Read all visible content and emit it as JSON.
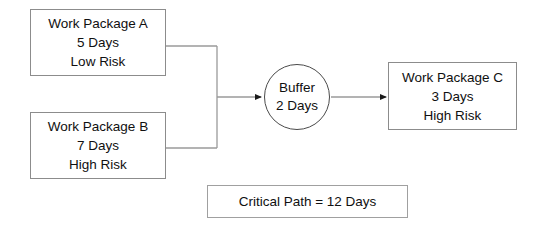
{
  "diagram": {
    "background_color": "#ffffff",
    "text_color": "#101010",
    "box_border_color": "#8c8c8c",
    "circle_border_color": "#4a4a4a",
    "edge_color": "#9a9a9a"
  },
  "nodes": {
    "work_package_a": {
      "name": "Work Package A",
      "duration": "5 Days",
      "risk": "Low Risk"
    },
    "work_package_b": {
      "name": "Work Package B",
      "duration": "7 Days",
      "risk": "High Risk"
    },
    "buffer": {
      "name": "Buffer",
      "duration": "2 Days"
    },
    "work_package_c": {
      "name": "Work Package C",
      "duration": "3 Days",
      "risk": "High Risk"
    }
  },
  "summary": {
    "critical_path": "Critical Path = 12 Days"
  },
  "edges": [
    {
      "from": "work_package_a",
      "to": "buffer",
      "arrowhead": true
    },
    {
      "from": "work_package_b",
      "to": "buffer",
      "arrowhead": true
    },
    {
      "from": "buffer",
      "to": "work_package_c",
      "arrowhead": true
    }
  ]
}
